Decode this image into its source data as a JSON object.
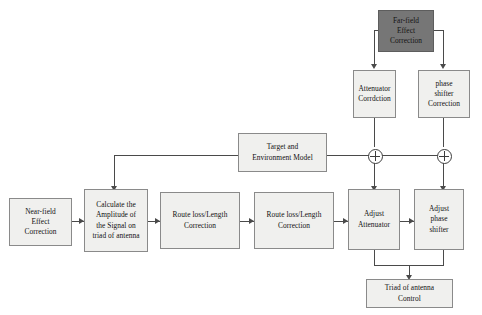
{
  "diagram": {
    "colors": {
      "box_fill": "#f0f0ee",
      "box_border": "#8a8a8a",
      "highlight_fill": "#767676",
      "line": "#4a4a4a",
      "page_background": "#ffffff"
    },
    "nodes": [
      {
        "id": "far_field",
        "label": "Far-field\nEffect\nCorrection",
        "style": "dark"
      },
      {
        "id": "atten_corr",
        "label": "Attenuator\nCorrdction",
        "style": "light"
      },
      {
        "id": "phase_corr",
        "label": "phase\nshifter\nCorrection",
        "style": "light"
      },
      {
        "id": "target_env",
        "label": "Target and\nEnvironment  Model",
        "style": "light"
      },
      {
        "id": "near_field",
        "label": "Near-field\nEffect\nCorrection",
        "style": "light"
      },
      {
        "id": "calc_amplitude",
        "label": "Calculate the\nAmplitude of\nthe Signal on\ntriad of antenna",
        "style": "light"
      },
      {
        "id": "route_loss_1",
        "label": "Route loss/Length\nCorrection",
        "style": "light"
      },
      {
        "id": "route_loss_2",
        "label": "Route loss/Length\nCorrection",
        "style": "light"
      },
      {
        "id": "adjust_atten",
        "label": "Adjust\nAttenuator",
        "style": "light"
      },
      {
        "id": "adjust_phase",
        "label": "Adjust\nphase\nshifter",
        "style": "light"
      },
      {
        "id": "triad_control",
        "label": "Triad of antenna\nControl",
        "style": "light"
      }
    ],
    "junctions": [
      {
        "id": "sum_attenuator",
        "symbol": "+"
      },
      {
        "id": "sum_phase",
        "symbol": "+"
      }
    ],
    "connections": [
      {
        "from": "near_field",
        "to": "calc_amplitude"
      },
      {
        "from": "calc_amplitude",
        "to": "route_loss_1"
      },
      {
        "from": "route_loss_1",
        "to": "route_loss_2"
      },
      {
        "from": "route_loss_2",
        "to": "adjust_atten"
      },
      {
        "from": "adjust_atten",
        "to": "adjust_phase"
      },
      {
        "from": "far_field",
        "to": "atten_corr"
      },
      {
        "from": "far_field",
        "to": "phase_corr"
      },
      {
        "from": "atten_corr",
        "to": "sum_attenuator"
      },
      {
        "from": "phase_corr",
        "to": "sum_phase"
      },
      {
        "from": "target_env",
        "to": "calc_amplitude"
      },
      {
        "from": "target_env",
        "to": "sum_attenuator"
      },
      {
        "from": "target_env",
        "to": "sum_phase"
      },
      {
        "from": "sum_attenuator",
        "to": "adjust_atten"
      },
      {
        "from": "sum_phase",
        "to": "adjust_phase"
      },
      {
        "from": "adjust_atten",
        "to": "triad_control"
      },
      {
        "from": "adjust_phase",
        "to": "triad_control"
      }
    ]
  }
}
